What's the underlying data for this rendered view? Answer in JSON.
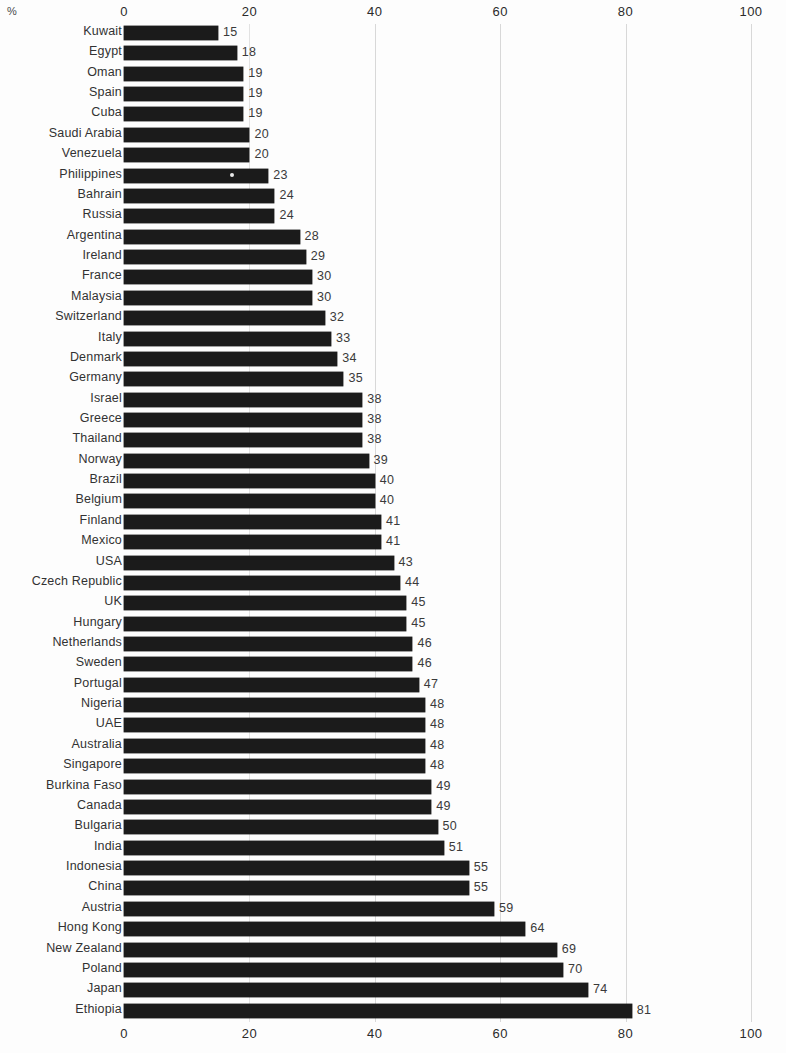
{
  "chart_data": {
    "type": "bar",
    "orientation": "horizontal",
    "title": "",
    "subtitle": "",
    "xlabel": "%",
    "ylabel": "",
    "unit_label": "%",
    "xlim": [
      0,
      100
    ],
    "xticks": [
      0,
      20,
      40,
      60,
      80,
      100
    ],
    "xtick_labels": [
      "0",
      "20",
      "40",
      "60",
      "80",
      "100"
    ],
    "grid": true,
    "grid_axis": "x",
    "axis_positions": [
      "top",
      "bottom"
    ],
    "legend": null,
    "bar_color": "#1b1b1b",
    "background_color": "#fdfdfd",
    "value_labels_shown": true,
    "sorted": "ascending",
    "categories": [
      "Kuwait",
      "Egypt",
      "Oman",
      "Spain",
      "Cuba",
      "Saudi Arabia",
      "Venezuela",
      "Philippines",
      "Bahrain",
      "Russia",
      "Argentina",
      "Ireland",
      "France",
      "Malaysia",
      "Switzerland",
      "Italy",
      "Denmark",
      "Germany",
      "Israel",
      "Greece",
      "Thailand",
      "Norway",
      "Brazil",
      "Belgium",
      "Finland",
      "Mexico",
      "USA",
      "Czech Republic",
      "UK",
      "Hungary",
      "Netherlands",
      "Sweden",
      "Portugal",
      "Nigeria",
      "UAE",
      "Australia",
      "Singapore",
      "Burkina Faso",
      "Canada",
      "Bulgaria",
      "India",
      "Indonesia",
      "China",
      "Austria",
      "Hong Kong",
      "New Zealand",
      "Poland",
      "Japan",
      "Ethiopia"
    ],
    "values": [
      15,
      18,
      19,
      19,
      19,
      20,
      20,
      23,
      24,
      24,
      28,
      29,
      30,
      30,
      32,
      33,
      34,
      35,
      38,
      38,
      38,
      39,
      40,
      40,
      41,
      41,
      43,
      44,
      45,
      45,
      46,
      46,
      47,
      48,
      48,
      48,
      48,
      49,
      49,
      50,
      51,
      55,
      55,
      59,
      64,
      69,
      70,
      74,
      81
    ],
    "value_labels": [
      "15",
      "18",
      "19",
      "19",
      "19",
      "20",
      "20",
      "23",
      "24",
      "24",
      "28",
      "29",
      "30",
      "30",
      "32",
      "33",
      "34",
      "35",
      "38",
      "38",
      "38",
      "39",
      "40",
      "40",
      "41",
      "41",
      "43",
      "44",
      "45",
      "45",
      "46",
      "46",
      "47",
      "48",
      "48",
      "48",
      "48",
      "49",
      "49",
      "50",
      "51",
      "55",
      "55",
      "59",
      "64",
      "69",
      "70",
      "74",
      "81"
    ]
  }
}
